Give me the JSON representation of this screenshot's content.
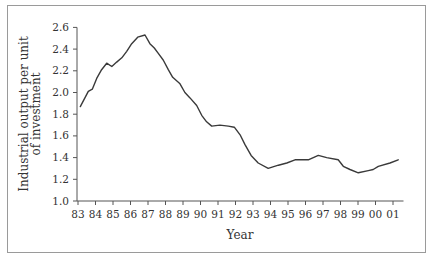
{
  "chart_data": {
    "type": "line",
    "title": "",
    "xlabel": "Year",
    "ylabel_lines": [
      "Industrial output per unit",
      "of investment"
    ],
    "xlim": [
      83,
      101.6
    ],
    "ylim": [
      1.0,
      2.6
    ],
    "grid": false,
    "legend": "none",
    "x_ticks": [
      83,
      84,
      85,
      86,
      87,
      88,
      89,
      90,
      91,
      92,
      93,
      94,
      95,
      96,
      97,
      98,
      99,
      100,
      101
    ],
    "x_tick_labels": [
      "83",
      "84",
      "85",
      "86",
      "87",
      "88",
      "89",
      "90",
      "91",
      "92",
      "93",
      "94",
      "95",
      "96",
      "97",
      "98",
      "99",
      "00",
      "01"
    ],
    "y_ticks": [
      1.0,
      1.2,
      1.4,
      1.6,
      1.8,
      2.0,
      2.2,
      2.4,
      2.6
    ],
    "y_tick_labels": [
      "1.0",
      "1.2",
      "1.4",
      "1.6",
      "1.8",
      "2.0",
      "2.2",
      "2.4",
      "2.6"
    ],
    "series": [
      {
        "name": "Industrial output per unit of investment",
        "color": "#3a3a3a",
        "x": [
          83.13,
          83.59,
          83.82,
          84.07,
          84.35,
          84.64,
          84.93,
          85.21,
          85.5,
          85.78,
          86.07,
          86.41,
          86.83,
          87.11,
          87.36,
          87.59,
          87.87,
          88.16,
          88.41,
          88.83,
          89.11,
          89.4,
          89.78,
          90.07,
          90.35,
          90.64,
          91.11,
          91.59,
          91.93,
          92.26,
          92.54,
          92.89,
          93.3,
          93.87,
          94.45,
          94.93,
          95.4,
          96.16,
          96.73,
          97.21,
          97.87,
          98.16,
          98.54,
          99.02,
          99.59,
          99.87,
          100.16,
          100.83,
          101.3
        ],
        "y": [
          1.87,
          2.01,
          2.03,
          2.13,
          2.21,
          2.27,
          2.24,
          2.28,
          2.32,
          2.38,
          2.45,
          2.51,
          2.53,
          2.45,
          2.41,
          2.36,
          2.3,
          2.21,
          2.14,
          2.08,
          2.0,
          1.95,
          1.88,
          1.79,
          1.73,
          1.69,
          1.7,
          1.69,
          1.68,
          1.61,
          1.52,
          1.42,
          1.35,
          1.3,
          1.33,
          1.35,
          1.38,
          1.38,
          1.42,
          1.4,
          1.38,
          1.32,
          1.29,
          1.26,
          1.28,
          1.29,
          1.32,
          1.35,
          1.38
        ]
      }
    ]
  }
}
